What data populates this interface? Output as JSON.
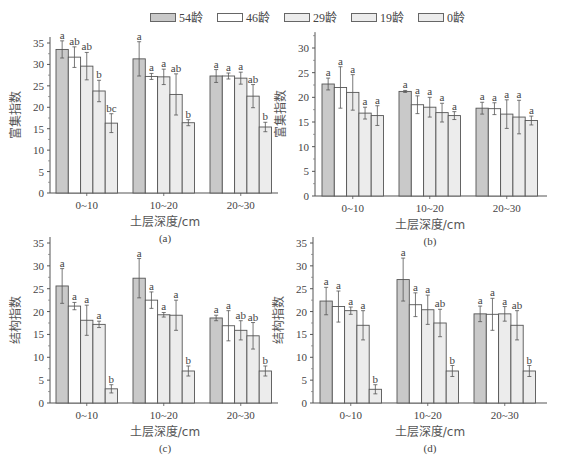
{
  "legend": {
    "items": [
      {
        "label": "54龄",
        "color": "#c9c9c9"
      },
      {
        "label": "46龄",
        "color": "#ffffff"
      },
      {
        "label": "29龄",
        "color": "#ececec"
      },
      {
        "label": "19龄",
        "color": "#ececec"
      },
      {
        "label": "0龄",
        "color": "#ececec"
      }
    ]
  },
  "caption": "",
  "chart_data": [
    {
      "panel": "(a)",
      "type": "bar",
      "title": "",
      "xlabel": "土层深度/cm",
      "ylabel": "富集指数",
      "categories": [
        "0~10",
        "10~20",
        "20~30"
      ],
      "ylim": [
        0,
        35
      ],
      "yticks": [
        0,
        5,
        10,
        15,
        20,
        25,
        30,
        35
      ],
      "series": [
        {
          "name": "54龄",
          "values": [
            33.5,
            31.3,
            27.3
          ],
          "errors": [
            2.0,
            4.0,
            1.5
          ],
          "letters": [
            "a",
            "a",
            "a"
          ]
        },
        {
          "name": "46龄",
          "values": [
            31.7,
            27.2,
            27.3
          ],
          "errors": [
            2.4,
            0.7,
            0.7
          ],
          "letters": [
            "ab",
            "a",
            "a"
          ]
        },
        {
          "name": "29龄",
          "values": [
            29.6,
            27.1,
            26.8
          ],
          "errors": [
            3.2,
            1.8,
            1.4
          ],
          "letters": [
            "ab",
            "a",
            "a"
          ]
        },
        {
          "name": "19龄",
          "values": [
            23.8,
            23.0,
            22.6
          ],
          "errors": [
            2.5,
            4.8,
            2.7
          ],
          "letters": [
            "b",
            "ab",
            "ab"
          ]
        },
        {
          "name": "0龄",
          "values": [
            16.3,
            16.4,
            15.4
          ],
          "errors": [
            2.2,
            0.7,
            1.1
          ],
          "letters": [
            "bc",
            "b",
            "b"
          ]
        }
      ]
    },
    {
      "panel": "(b)",
      "type": "bar",
      "title": "",
      "xlabel": "土层深度/cm",
      "ylabel": "富集指数",
      "categories": [
        "0~10",
        "10~20",
        "20~30"
      ],
      "ylim": [
        0,
        32
      ],
      "yticks": [
        0,
        5,
        10,
        15,
        20,
        25,
        30
      ],
      "series": [
        {
          "name": "54龄",
          "values": [
            22.7,
            21.2,
            17.8
          ],
          "errors": [
            1.2,
            0.2,
            1.2
          ],
          "letters": [
            "a",
            "a",
            "a"
          ]
        },
        {
          "name": "46龄",
          "values": [
            22.0,
            18.5,
            17.7
          ],
          "errors": [
            4.2,
            1.8,
            1.2
          ],
          "letters": [
            "a",
            "a",
            "a"
          ]
        },
        {
          "name": "29龄",
          "values": [
            21.0,
            18.0,
            16.6
          ],
          "errors": [
            3.6,
            2.0,
            2.9
          ],
          "letters": [
            "a",
            "a",
            "a"
          ]
        },
        {
          "name": "19龄",
          "values": [
            16.8,
            16.9,
            16.0
          ],
          "errors": [
            1.2,
            1.9,
            3.4
          ],
          "letters": [
            "a",
            "a",
            "a"
          ]
        },
        {
          "name": "0龄",
          "values": [
            16.3,
            16.3,
            15.3
          ],
          "errors": [
            2.0,
            0.8,
            0.9
          ],
          "letters": [
            "a",
            "a",
            "a"
          ]
        }
      ]
    },
    {
      "panel": "(c)",
      "type": "bar",
      "title": "",
      "xlabel": "土层深度/cm",
      "ylabel": "结构指数",
      "categories": [
        "0~10",
        "10~20",
        "20~30"
      ],
      "ylim": [
        0,
        35
      ],
      "yticks": [
        0,
        5,
        10,
        15,
        20,
        25,
        30,
        35
      ],
      "series": [
        {
          "name": "54龄",
          "values": [
            25.6,
            27.3,
            18.6
          ],
          "errors": [
            3.8,
            4.3,
            0.6
          ],
          "letters": [
            "a",
            "a",
            "a"
          ]
        },
        {
          "name": "46龄",
          "values": [
            21.2,
            22.5,
            16.9
          ],
          "errors": [
            0.8,
            1.8,
            3.3
          ],
          "letters": [
            "a",
            "a",
            "a"
          ]
        },
        {
          "name": "29龄",
          "values": [
            18.1,
            19.3,
            15.9
          ],
          "errors": [
            3.3,
            0.5,
            2.1
          ],
          "letters": [
            "a",
            "a",
            "ab"
          ]
        },
        {
          "name": "19龄",
          "values": [
            17.2,
            19.2,
            14.7
          ],
          "errors": [
            0.7,
            3.3,
            2.9
          ],
          "letters": [
            "a",
            "a",
            "ab"
          ]
        },
        {
          "name": "0龄",
          "values": [
            3.1,
            7.0,
            7.0
          ],
          "errors": [
            0.9,
            1.1,
            1.1
          ],
          "letters": [
            "b",
            "b",
            "b"
          ]
        }
      ]
    },
    {
      "panel": "(d)",
      "type": "bar",
      "title": "",
      "xlabel": "土层深度/cm",
      "ylabel": "结构指数",
      "categories": [
        "0~10",
        "10~20",
        "20~30"
      ],
      "ylim": [
        0,
        35
      ],
      "yticks": [
        0,
        5,
        10,
        15,
        20,
        25,
        30,
        35
      ],
      "series": [
        {
          "name": "54龄",
          "values": [
            22.3,
            27.0,
            19.5
          ],
          "errors": [
            3.0,
            4.7,
            1.7
          ],
          "letters": [
            "a",
            "a",
            "a"
          ]
        },
        {
          "name": "46龄",
          "values": [
            21.1,
            21.5,
            19.4
          ],
          "errors": [
            3.4,
            2.6,
            3.5
          ],
          "letters": [
            "a",
            "a",
            "a"
          ]
        },
        {
          "name": "29龄",
          "values": [
            20.2,
            20.4,
            19.5
          ],
          "errors": [
            0.8,
            3.2,
            1.6
          ],
          "letters": [
            "a",
            "a",
            "a"
          ]
        },
        {
          "name": "19龄",
          "values": [
            17.0,
            17.5,
            17.0
          ],
          "errors": [
            3.2,
            3.0,
            3.2
          ],
          "letters": [
            "a",
            "ab",
            "ab"
          ]
        },
        {
          "name": "0龄",
          "values": [
            3.0,
            7.0,
            7.0
          ],
          "errors": [
            1.0,
            1.2,
            1.2
          ],
          "letters": [
            "b",
            "b",
            "b"
          ]
        }
      ]
    }
  ]
}
